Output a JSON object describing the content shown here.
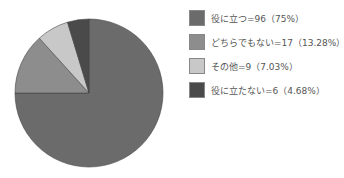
{
  "chart_data": {
    "type": "pie",
    "title": "",
    "start_angle": "12 o'clock, clockwise",
    "slices": [
      {
        "label": "役に立つ",
        "value": 96,
        "percent": 75,
        "color": "#6b6b6b"
      },
      {
        "label": "どちらでもない",
        "value": 17,
        "percent": 13.28,
        "color": "#8d8d8d"
      },
      {
        "label": "その他",
        "value": 9,
        "percent": 7.03,
        "color": "#c8c8c8"
      },
      {
        "label": "役に立たない",
        "value": 6,
        "percent": 4.68,
        "color": "#4a4a4a"
      }
    ],
    "legend_position": "right"
  },
  "legend": [
    {
      "text": "役に立つ=96（75%）"
    },
    {
      "text": "どちらでもない=17（13.28%）"
    },
    {
      "text": "その他=9（7.03%）"
    },
    {
      "text": "役に立たない=6（4.68%）"
    }
  ]
}
